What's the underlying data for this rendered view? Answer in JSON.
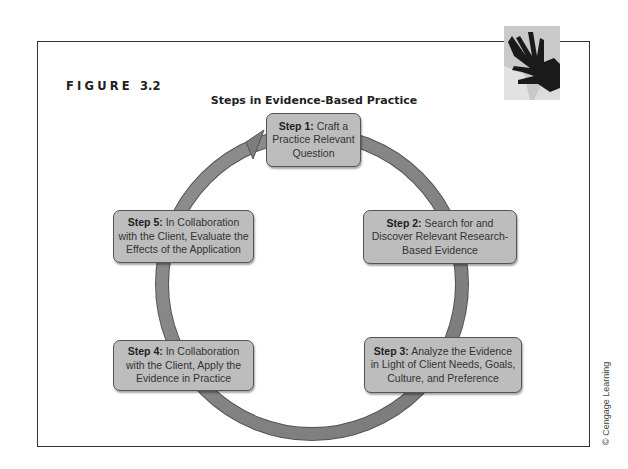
{
  "figure": {
    "label_word": "FIGURE",
    "label_number": "3.2",
    "title": "Steps in Evidence-Based Practice",
    "credit": "© Cengage Learning",
    "image_description": "hands-photo"
  },
  "steps": [
    {
      "id": "step-1",
      "label": "Step 1:",
      "text": " Craft a Practice Relevant Question"
    },
    {
      "id": "step-2",
      "label": "Step 2:",
      "text": " Search for and Discover Relevant Research-Based Evidence"
    },
    {
      "id": "step-3",
      "label": "Step 3:",
      "text": " Analyze the Evidence in Light of Client Needs, Goals, Culture, and Preference"
    },
    {
      "id": "step-4",
      "label": "Step 4:",
      "text": " In Collaboration with the Client, Apply the Evidence in Practice"
    },
    {
      "id": "step-5",
      "label": "Step 5:",
      "text": " In Collaboration with the Client, Evaluate the Effects of the Application"
    }
  ],
  "colors": {
    "box_fill": "#bdbdbd",
    "ring": "#8a8a8a",
    "frame": "#333333"
  }
}
